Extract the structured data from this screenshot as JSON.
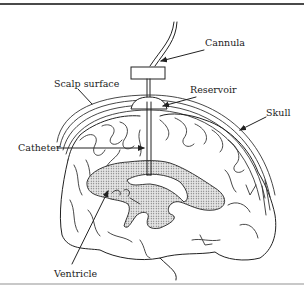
{
  "diagram": {
    "type": "labeled-anatomical-illustration",
    "labels": {
      "cannula": "Cannula",
      "scalp_surface": "Scalp surface",
      "reservoir": "Reservoir",
      "skull": "Skull",
      "catheter": "Catheter",
      "ventricle": "Ventricle"
    },
    "colors": {
      "line": "#222222",
      "ventricle_fill": "#d8d8d8",
      "background": "#ffffff",
      "top_rule": "#4a4a4a",
      "bottom_rule": "#c8c8c8"
    }
  }
}
